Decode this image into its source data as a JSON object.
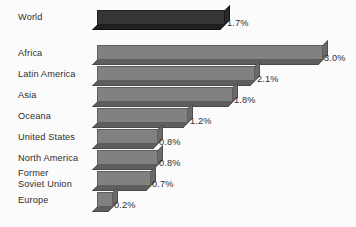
{
  "chart_data": {
    "type": "bar",
    "orientation": "horizontal",
    "title": "",
    "subtitle": "",
    "xlabel": "",
    "ylabel": "",
    "grid": false,
    "legend": null,
    "axis_visible": false,
    "value_suffix": "%",
    "xlim": [
      0,
      3.0
    ],
    "style": {
      "background": "#fbfbfb",
      "bar_fill": "#818181",
      "bar_fill_highlight": "#353535",
      "bar_edge": "#5d5d5d",
      "text_color": "#2e2e2e",
      "effect": "3d-extruded"
    },
    "categories": [
      "World",
      "Africa",
      "Latin America",
      "Asia",
      "Oceana",
      "United States",
      "North America",
      "Former\nSoviet Union",
      "Europe"
    ],
    "values": [
      1.7,
      3.0,
      2.1,
      1.8,
      1.2,
      0.8,
      0.8,
      0.7,
      0.2
    ],
    "value_labels": [
      "1.7%",
      "3.0%",
      "2.1%",
      "1.8%",
      "1.2%",
      "0.8%",
      "0.8%",
      "0.7%",
      "0.2%"
    ],
    "highlighted": [
      0
    ],
    "bars": [
      {
        "label": "World",
        "value": 1.7,
        "value_label": "1.7%",
        "highlighted": true,
        "label_top": 12,
        "bar_top": 10,
        "bar_width": 128,
        "value_left": 227,
        "value_top": 18
      },
      {
        "label": "Africa",
        "value": 3.0,
        "value_label": "3.0%",
        "highlighted": false,
        "label_top": 48,
        "bar_top": 45,
        "bar_width": 226,
        "value_left": 324,
        "value_top": 53
      },
      {
        "label": "Latin America",
        "value": 2.1,
        "value_label": "2.1%",
        "highlighted": false,
        "label_top": 69,
        "bar_top": 66,
        "bar_width": 158,
        "value_left": 257,
        "value_top": 74
      },
      {
        "label": "Asia",
        "value": 1.8,
        "value_label": "1.8%",
        "highlighted": false,
        "label_top": 90,
        "bar_top": 87,
        "bar_width": 136,
        "value_left": 234,
        "value_top": 95
      },
      {
        "label": "Oceana",
        "value": 1.2,
        "value_label": "1.2%",
        "highlighted": false,
        "label_top": 111,
        "bar_top": 108,
        "bar_width": 91,
        "value_left": 190,
        "value_top": 116
      },
      {
        "label": "United States",
        "value": 0.8,
        "value_label": "0.8%",
        "highlighted": false,
        "label_top": 132,
        "bar_top": 129,
        "bar_width": 61,
        "value_left": 159,
        "value_top": 137
      },
      {
        "label": "North America",
        "value": 0.8,
        "value_label": "0.8%",
        "highlighted": false,
        "label_top": 153,
        "bar_top": 150,
        "bar_width": 61,
        "value_left": 159,
        "value_top": 158
      },
      {
        "label": "Former\nSoviet Union",
        "value": 0.7,
        "value_label": "0.7%",
        "highlighted": false,
        "label_top": 168,
        "bar_top": 171,
        "bar_width": 54,
        "value_left": 152,
        "value_top": 179
      },
      {
        "label": "Europe",
        "value": 0.2,
        "value_label": "0.2%",
        "highlighted": false,
        "label_top": 195,
        "bar_top": 192,
        "bar_width": 16,
        "value_left": 114,
        "value_top": 200
      }
    ]
  }
}
